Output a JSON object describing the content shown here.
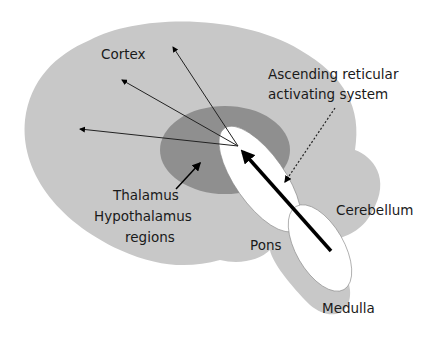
{
  "diagram": {
    "labels": {
      "cortex": "Cortex",
      "aras_line1": "Ascending reticular",
      "aras_line2": "activating system",
      "thalamus_line1": "Thalamus",
      "thalamus_line2": "Hypothalamus",
      "thalamus_line3": "regions",
      "cerebellum": "Cerebellum",
      "pons": "Pons",
      "medulla": "Medulla"
    },
    "colors": {
      "brain": "#c8c8c8",
      "thalamus": "#8f8f8f",
      "brainstem": "#ffffff",
      "arrow": "#000000"
    }
  }
}
